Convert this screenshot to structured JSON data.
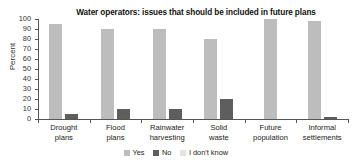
{
  "chart_data": {
    "type": "bar",
    "title": "Water operators: issues that should be included in future plans",
    "xlabel": "",
    "ylabel": "Percent",
    "ylim": [
      0,
      100
    ],
    "yticks": [
      0,
      10,
      20,
      30,
      40,
      50,
      60,
      70,
      80,
      90,
      100
    ],
    "grid": false,
    "legend_position": "bottom",
    "categories": [
      "Drought plans",
      "Flood plans",
      "Rainwater harvesting",
      "Solid waste",
      "Future population",
      "Informal settlements"
    ],
    "category_lines": [
      [
        "Drought",
        "plans"
      ],
      [
        "Flood",
        "plans"
      ],
      [
        "Rainwater",
        "harvesting"
      ],
      [
        "Solid",
        "waste"
      ],
      [
        "Future",
        "population"
      ],
      [
        "Informal",
        "settlements"
      ]
    ],
    "series": [
      {
        "name": "Yes",
        "color": "#bdbdbd",
        "values": [
          95,
          90,
          90,
          80,
          100,
          98
        ]
      },
      {
        "name": "No",
        "color": "#5e5e5e",
        "values": [
          5,
          10,
          10,
          20,
          0,
          2
        ]
      },
      {
        "name": "I don't know",
        "color": "#e3e3e3",
        "values": [
          0,
          0,
          0,
          0,
          0,
          0
        ]
      }
    ]
  },
  "legend": {
    "items": [
      {
        "label": "Yes",
        "color": "#bdbdbd"
      },
      {
        "label": "No",
        "color": "#5e5e5e"
      },
      {
        "label": "I don't know",
        "color": "#e3e3e3"
      }
    ]
  }
}
